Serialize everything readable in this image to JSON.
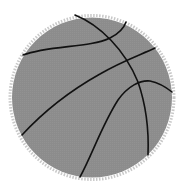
{
  "image": {
    "subject": "basketball",
    "icon": "basketball-icon",
    "colors": {
      "fill": "#8c8c8c",
      "edge": "#c8c8c8",
      "seams": "#111111",
      "background": "#ffffff"
    }
  }
}
